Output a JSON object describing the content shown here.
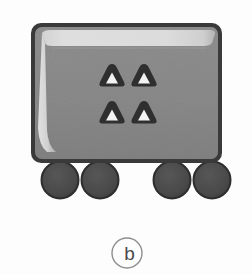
{
  "figure": {
    "caption_label": "b",
    "background_color": "#fdfdfd",
    "object_name": "wheeled-container",
    "description_visible": false
  },
  "body_panel": {
    "name": "container-body",
    "border_color": "#3a3a3a",
    "fill_color": "#8a8a8a",
    "fill_color_lower": "#868686",
    "gloss_color": "#dcdcdc",
    "gloss_color_soft": "#c2c2c2",
    "x": 31,
    "y": 23,
    "width": 191,
    "height": 140,
    "corner_radius": 9,
    "border_width": 5
  },
  "markings": {
    "name": "triangle-warning-marks",
    "count": 4,
    "outline_color": "#2f2f2f",
    "inner_color": "#f2f2f2",
    "items": [
      {
        "label": "triangle-top-left",
        "cx": 112,
        "cy": 76,
        "size": 19
      },
      {
        "label": "triangle-top-right",
        "cx": 144,
        "cy": 76,
        "size": 19
      },
      {
        "label": "triangle-bottom-left",
        "cx": 112,
        "cy": 113,
        "size": 19
      },
      {
        "label": "triangle-bottom-right",
        "cx": 144,
        "cy": 113,
        "size": 19
      }
    ]
  },
  "wheels": {
    "name": "wheel-set",
    "count": 4,
    "fill_color": "#4c4c4c",
    "stroke_color": "#303030",
    "radius": 18,
    "items": [
      {
        "label": "wheel-1",
        "cx": 60,
        "cy": 180
      },
      {
        "label": "wheel-2",
        "cx": 100,
        "cy": 180
      },
      {
        "label": "wheel-3",
        "cx": 172,
        "cy": 180
      },
      {
        "label": "wheel-4",
        "cx": 212,
        "cy": 180
      }
    ]
  },
  "caption": {
    "name": "figure-caption",
    "text": "b",
    "circle_cx": 127,
    "circle_cy": 253,
    "circle_r": 15,
    "circle_stroke": "#8e8e8e",
    "text_color": "#4a4a4a"
  }
}
